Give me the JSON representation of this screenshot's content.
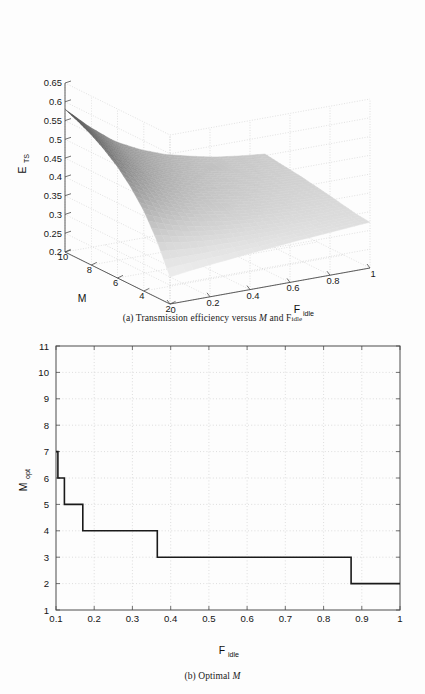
{
  "document": {
    "kind": "figure-pair",
    "background_color": "#fdfdfd",
    "axis_color": "#4d4d4d",
    "grid_color": "#c8c8c8",
    "line_color": "#1a1a1a"
  },
  "panel_a": {
    "caption_prefix": "(a) Transmission efficiency versus ",
    "caption_italic": "M",
    "caption_mid": " and F",
    "caption_sub": "idle",
    "zlabel_main": "E",
    "zlabel_sub": "TS",
    "xlabel_main": "M",
    "ylabel_main": "F",
    "ylabel_sub": "idle"
  },
  "panel_b": {
    "caption_prefix": "(b) Optimal ",
    "caption_italic": "M",
    "ylabel_main": "M",
    "ylabel_sub": "opt",
    "xlabel_main": "F",
    "xlabel_sub": "idle"
  },
  "chart_data": [
    {
      "type": "surface",
      "title": "Transmission efficiency versus M and F_idle",
      "panel": "a",
      "xlabel": "M",
      "ylabel": "F_idle",
      "zlabel": "E_TS",
      "xlim": [
        2,
        10
      ],
      "ylim": [
        0,
        1
      ],
      "zlim": [
        0.2,
        0.65
      ],
      "x_ticks": [
        10,
        8,
        6,
        4,
        2
      ],
      "y_ticks": [
        0,
        0.2,
        0.4,
        0.6,
        0.8,
        1
      ],
      "z_ticks": [
        0.2,
        0.25,
        0.3,
        0.35,
        0.4,
        0.45,
        0.5,
        0.55,
        0.6,
        0.65
      ],
      "grid": true,
      "legend": "none",
      "view_azimuth_deg": -37.5,
      "view_elevation_deg": 30,
      "colormap": "gray",
      "surface_note": "Smooth saddle-like sheet: highest E_TS (~0.58) at M=10, F_idle=0; falls steeply toward a trough near M=2-4 and low F_idle (~0.27), then flattens out to ~0.34 as F_idle approaches 1.",
      "grid_x": [
        10,
        9,
        8,
        7,
        6,
        5,
        4,
        3,
        2
      ],
      "grid_y": [
        0,
        0.125,
        0.25,
        0.375,
        0.5,
        0.625,
        0.75,
        0.875,
        1
      ],
      "z_matrix": [
        [
          0.58,
          0.52,
          0.47,
          0.437,
          0.412,
          0.395,
          0.381,
          0.372,
          0.365
        ],
        [
          0.565,
          0.505,
          0.458,
          0.427,
          0.404,
          0.388,
          0.376,
          0.367,
          0.36
        ],
        [
          0.547,
          0.489,
          0.445,
          0.416,
          0.396,
          0.381,
          0.37,
          0.362,
          0.356
        ],
        [
          0.524,
          0.47,
          0.43,
          0.404,
          0.386,
          0.373,
          0.363,
          0.356,
          0.351
        ],
        [
          0.496,
          0.447,
          0.412,
          0.39,
          0.375,
          0.364,
          0.355,
          0.349,
          0.345
        ],
        [
          0.46,
          0.42,
          0.392,
          0.374,
          0.362,
          0.353,
          0.347,
          0.342,
          0.339
        ],
        [
          0.414,
          0.385,
          0.366,
          0.354,
          0.346,
          0.34,
          0.336,
          0.333,
          0.332
        ],
        [
          0.352,
          0.339,
          0.331,
          0.326,
          0.324,
          0.323,
          0.323,
          0.324,
          0.325
        ],
        [
          0.272,
          0.281,
          0.288,
          0.295,
          0.301,
          0.307,
          0.312,
          0.317,
          0.322
        ]
      ]
    },
    {
      "type": "line",
      "subtype": "stairs",
      "title": "Optimal M",
      "panel": "b",
      "xlabel": "F_idle",
      "ylabel": "M_opt",
      "xlim": [
        0.1,
        1
      ],
      "ylim": [
        1,
        11
      ],
      "x_ticks": [
        0.1,
        0.2,
        0.3,
        0.4,
        0.5,
        0.6,
        0.7,
        0.8,
        0.9,
        1
      ],
      "y_ticks": [
        1,
        2,
        3,
        4,
        5,
        6,
        7,
        8,
        9,
        10,
        11
      ],
      "grid": true,
      "legend": "none",
      "line_width": 1.6,
      "steps": [
        {
          "x_start": 0.1,
          "x_end": 0.105,
          "y": 7
        },
        {
          "x_start": 0.105,
          "x_end": 0.122,
          "y": 6
        },
        {
          "x_start": 0.122,
          "x_end": 0.17,
          "y": 5
        },
        {
          "x_start": 0.17,
          "x_end": 0.365,
          "y": 4
        },
        {
          "x_start": 0.365,
          "x_end": 0.872,
          "y": 3
        },
        {
          "x_start": 0.872,
          "x_end": 1.0,
          "y": 2
        }
      ]
    }
  ]
}
